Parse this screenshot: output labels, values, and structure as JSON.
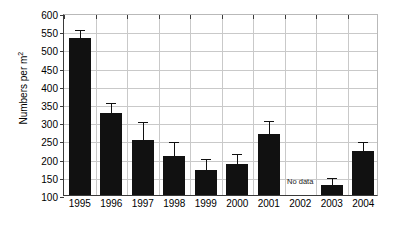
{
  "chart_data": {
    "type": "bar",
    "title": "",
    "xlabel": "",
    "ylabel": "Numbers per m2",
    "ylabel_base": "Numbers per m",
    "ylabel_sup": "2",
    "categories": [
      "1995",
      "1996",
      "1997",
      "1998",
      "1999",
      "2000",
      "2001",
      "2002",
      "2003",
      "2004"
    ],
    "values": [
      530,
      325,
      250,
      207,
      170,
      185,
      268,
      null,
      128,
      220
    ],
    "error_upper": [
      560,
      357,
      305,
      252,
      205,
      218,
      310,
      null,
      153,
      250
    ],
    "annotations": [
      {
        "category": "2002",
        "text": "No data",
        "value": 140
      }
    ],
    "ylim": [
      100,
      600
    ],
    "ytick_step": 50,
    "yticks": [
      100,
      150,
      200,
      250,
      300,
      350,
      400,
      450,
      500,
      550,
      600
    ],
    "ytick_labels": [
      "100",
      "150",
      "200",
      "250",
      "300",
      "350",
      "400",
      "450",
      "500",
      "550",
      "600"
    ],
    "grid": {
      "horizontal": true,
      "vertical": true
    },
    "legend": {
      "visible": false
    },
    "bar_color": "#111111",
    "grid_color": "#c9c9c9",
    "axis_color": "#3a3a3a",
    "background": "#ffffff"
  }
}
